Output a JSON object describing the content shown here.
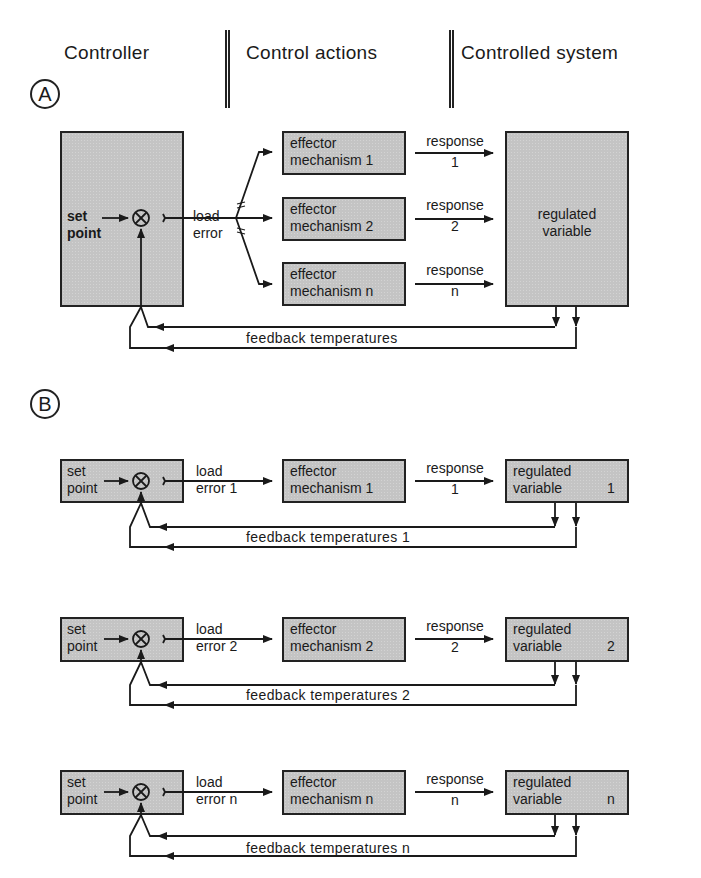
{
  "header": {
    "columns": [
      "Controller",
      "Control actions",
      "Controlled system"
    ]
  },
  "panels": {
    "A": {
      "label": "A",
      "controller": {
        "setpoint_line1": "set",
        "setpoint_line2": "point",
        "comparator_symbol": "⊗"
      },
      "load_error": {
        "line1": "load",
        "line2": "error"
      },
      "effectors": [
        {
          "line1": "effector",
          "line2": "mechanism  1",
          "response_label": "response",
          "response_index": "1"
        },
        {
          "line1": "effector",
          "line2": "mechanism  2",
          "response_label": "response",
          "response_index": "2"
        },
        {
          "line1": "effector",
          "line2": "mechanism  n",
          "response_label": "response",
          "response_index": "n"
        }
      ],
      "regulated": {
        "line1": "regulated",
        "line2": "variable"
      },
      "feedback_label": "feedback  temperatures"
    },
    "B": {
      "label": "B",
      "rows": [
        {
          "setpoint_line1": "set",
          "setpoint_line2": "point",
          "comparator_symbol": "⊗",
          "load_line1": "load",
          "load_line2": "error  1",
          "effector_line1": "effector",
          "effector_line2": "mechanism  1",
          "response_label": "response",
          "response_index": "1",
          "regulated_line1": "regulated",
          "regulated_line2": "variable",
          "regulated_index": "1",
          "feedback_label": "feedback  temperatures   1"
        },
        {
          "setpoint_line1": "set",
          "setpoint_line2": "point",
          "comparator_symbol": "⊗",
          "load_line1": "load",
          "load_line2": "error  2",
          "effector_line1": "effector",
          "effector_line2": "mechanism  2",
          "response_label": "response",
          "response_index": "2",
          "regulated_line1": "regulated",
          "regulated_line2": "variable",
          "regulated_index": "2",
          "feedback_label": "feedback  temperatures   2"
        },
        {
          "setpoint_line1": "set",
          "setpoint_line2": "point",
          "comparator_symbol": "⊗",
          "load_line1": "load",
          "load_line2": "error  n",
          "effector_line1": "effector",
          "effector_line2": "mechanism  n",
          "response_label": "response",
          "response_index": "n",
          "regulated_line1": "regulated",
          "regulated_line2": "variable",
          "regulated_index": "n",
          "feedback_label": "feedback  temperatures   n"
        }
      ]
    }
  },
  "colors": {
    "line": "#1a1a1a",
    "box_fill": "#c4c4c4",
    "background": "#ffffff"
  }
}
